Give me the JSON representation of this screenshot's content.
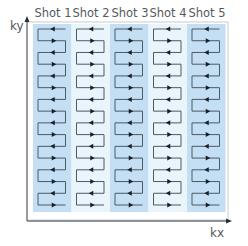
{
  "diagram": {
    "axes": {
      "y_label": "ky",
      "x_label": "kx"
    },
    "shots": [
      {
        "label": "Shot 1",
        "shaded": true
      },
      {
        "label": "Shot 2",
        "shaded": false
      },
      {
        "label": "Shot 3",
        "shaded": true
      },
      {
        "label": "Shot 4",
        "shaded": false
      },
      {
        "label": "Shot 5",
        "shaded": true
      }
    ],
    "lines_per_shot": 16,
    "trajectory": "zigzag raster: first line right-to-left, alternating direction, joined at alternating ends",
    "colors": {
      "shaded_column": "#c4def3",
      "shaded_column_edge": "#b3d4ef",
      "light_column": "#eaf4fb",
      "trajectory_line": "#4a5a66",
      "arrow": "#1a1f24",
      "axis": "#6e7378",
      "frame": "#b5b8bb",
      "text": "#555a5e"
    }
  }
}
